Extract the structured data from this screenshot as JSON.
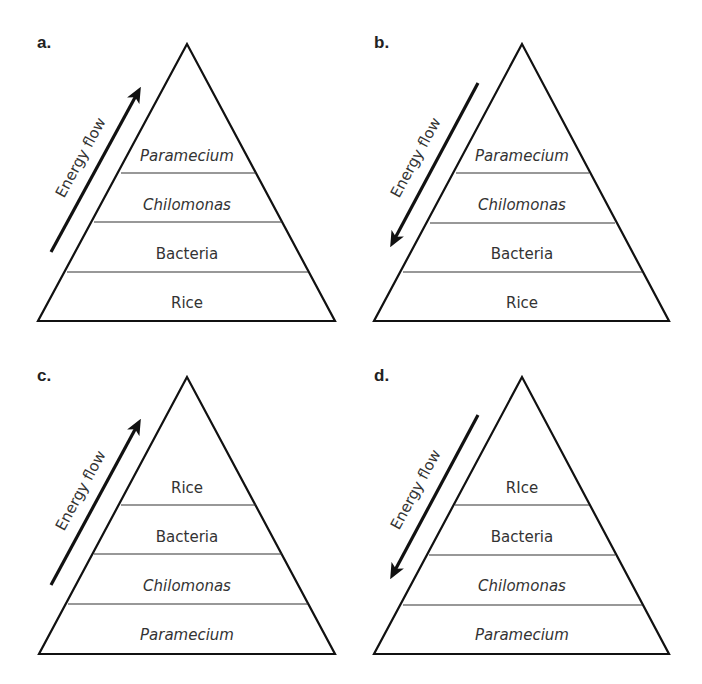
{
  "figure": {
    "energy_flow_label": "Energy flow",
    "panels": [
      {
        "label": "a.",
        "arrow_direction": "up",
        "tiers_top_to_bottom": [
          {
            "name": "Paramecium",
            "italic": true
          },
          {
            "name": "Chilomonas",
            "italic": true
          },
          {
            "name": "Bacteria",
            "italic": false
          },
          {
            "name": "Rice",
            "italic": false
          }
        ]
      },
      {
        "label": "b.",
        "arrow_direction": "down",
        "tiers_top_to_bottom": [
          {
            "name": "Paramecium",
            "italic": true
          },
          {
            "name": "Chilomonas",
            "italic": true
          },
          {
            "name": "Bacteria",
            "italic": false
          },
          {
            "name": "Rice",
            "italic": false
          }
        ]
      },
      {
        "label": "c.",
        "arrow_direction": "up",
        "tiers_top_to_bottom": [
          {
            "name": "Rice",
            "italic": false
          },
          {
            "name": "Bacteria",
            "italic": false
          },
          {
            "name": "Chilomonas",
            "italic": true
          },
          {
            "name": "Paramecium",
            "italic": true
          }
        ]
      },
      {
        "label": "d.",
        "arrow_direction": "down",
        "tiers_top_to_bottom": [
          {
            "name": "RIce",
            "italic": false
          },
          {
            "name": "Bacteria",
            "italic": false
          },
          {
            "name": "Chilomonas",
            "italic": true
          },
          {
            "name": "Paramecium",
            "italic": true
          }
        ]
      }
    ]
  }
}
